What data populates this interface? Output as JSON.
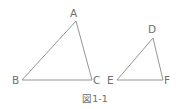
{
  "figure": {
    "caption": "図1-1",
    "triangles": [
      {
        "name": "ABC",
        "vertices": [
          {
            "label": "A",
            "x": 76,
            "y": 21
          },
          {
            "label": "B",
            "x": 22,
            "y": 80
          },
          {
            "label": "C",
            "x": 92,
            "y": 80
          }
        ]
      },
      {
        "name": "DEF",
        "vertices": [
          {
            "label": "D",
            "x": 153,
            "y": 38
          },
          {
            "label": "E",
            "x": 117,
            "y": 80
          },
          {
            "label": "F",
            "x": 163,
            "y": 80
          }
        ]
      }
    ],
    "colors": {
      "line": "#8a8a8a",
      "text": "#6e6e6e",
      "background": "#ffffff"
    }
  }
}
